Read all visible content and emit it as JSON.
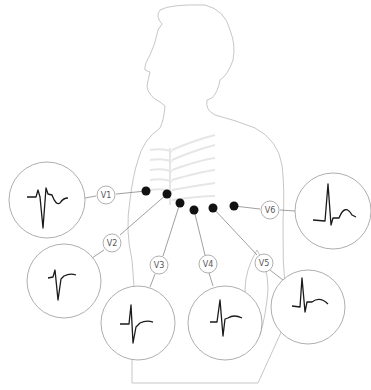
{
  "diagram": {
    "leads": [
      {
        "label": "V1"
      },
      {
        "label": "V2"
      },
      {
        "label": "V3"
      },
      {
        "label": "V4"
      },
      {
        "label": "V5"
      },
      {
        "label": "V6"
      }
    ],
    "colors": {
      "outline": "#b8b8b8",
      "ribs": "#e6e6e6",
      "electrode": "#111111",
      "trace": "#1a1a1a",
      "connector": "#888888"
    }
  }
}
